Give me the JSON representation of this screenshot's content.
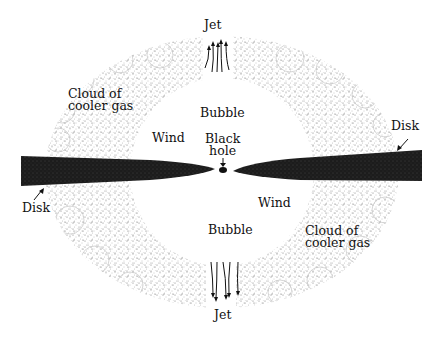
{
  "diagram": {
    "type": "black-hole-accretion-schematic",
    "colors": {
      "background": "#ffffff",
      "disk": "#1a1a1a",
      "cloud_stipple": "#8a8a8a",
      "text": "#111111"
    },
    "labels": {
      "jet_top": "Jet",
      "jet_bottom": "Jet",
      "cloud_left_line1": "Cloud of",
      "cloud_left_line2": "cooler gas",
      "cloud_right_line1": "Cloud of",
      "cloud_right_line2": "cooler gas",
      "bubble_top": "Bubble",
      "bubble_bottom": "Bubble",
      "wind_left": "Wind",
      "wind_right": "Wind",
      "black_hole_line1": "Black",
      "black_hole_line2": "hole",
      "disk_left": "Disk",
      "disk_right": "Disk"
    },
    "components": [
      {
        "name": "cloud-of-cooler-gas",
        "shape": "stippled elliptical ring"
      },
      {
        "name": "accretion-disk",
        "shape": "two dark tapered wedges pointing at center"
      },
      {
        "name": "black-hole",
        "shape": "small dark oval at center"
      },
      {
        "name": "jet-top",
        "shape": "arrow bundle pointing up"
      },
      {
        "name": "jet-bottom",
        "shape": "arrow bundle pointing down"
      }
    ]
  }
}
